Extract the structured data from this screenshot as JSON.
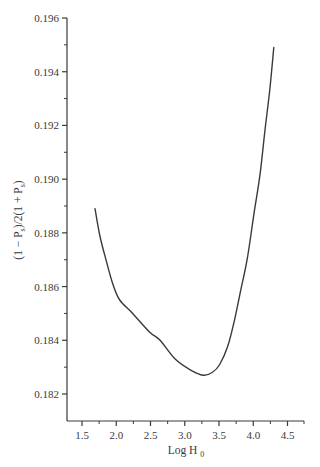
{
  "chart_data": {
    "type": "line",
    "title": "",
    "xlabel": "Log H",
    "xlabel_subscript": "0",
    "ylabel_parts": [
      "(1 − P",
      "s",
      ")/2(1 + P",
      "s",
      ")"
    ],
    "ylabel": "(1 − Ps)/2(1 + Ps)",
    "xlim": [
      1.27,
      4.81
    ],
    "ylim": [
      0.181,
      0.196
    ],
    "x_ticks": [
      1.5,
      2.0,
      2.5,
      3.0,
      3.5,
      4.0,
      4.5
    ],
    "x_tick_labels": [
      "1.5",
      "2.0",
      "2.5",
      "3.0",
      "3.5",
      "4.0",
      "4.5"
    ],
    "x_minor_ticks": [
      1.75,
      2.25,
      2.75,
      3.25,
      3.75,
      4.25
    ],
    "y_ticks": [
      0.182,
      0.184,
      0.186,
      0.188,
      0.19,
      0.192,
      0.194,
      0.196
    ],
    "y_tick_labels": [
      "0.182",
      "0.184",
      "0.186",
      "0.188",
      "0.190",
      "0.192",
      "0.194",
      "0.196"
    ],
    "y_minor_ticks": [
      0.183,
      0.185,
      0.187,
      0.189,
      0.191,
      0.193,
      0.195
    ],
    "grid": false,
    "legend": null,
    "series": [
      {
        "name": "curve",
        "color": "#3a3a3a",
        "x": [
          1.69,
          1.76,
          1.85,
          1.95,
          2.05,
          2.24,
          2.49,
          2.64,
          2.86,
          3.08,
          3.27,
          3.4,
          3.51,
          3.63,
          3.73,
          3.82,
          3.91,
          4.01,
          4.1,
          4.17,
          4.24,
          4.3
        ],
        "y": [
          0.1889,
          0.1879,
          0.187,
          0.1861,
          0.1855,
          0.185,
          0.1843,
          0.184,
          0.1833,
          0.1829,
          0.1827,
          0.1828,
          0.1831,
          0.1838,
          0.1848,
          0.1859,
          0.187,
          0.1887,
          0.1902,
          0.1918,
          0.1933,
          0.1949
        ]
      }
    ]
  }
}
